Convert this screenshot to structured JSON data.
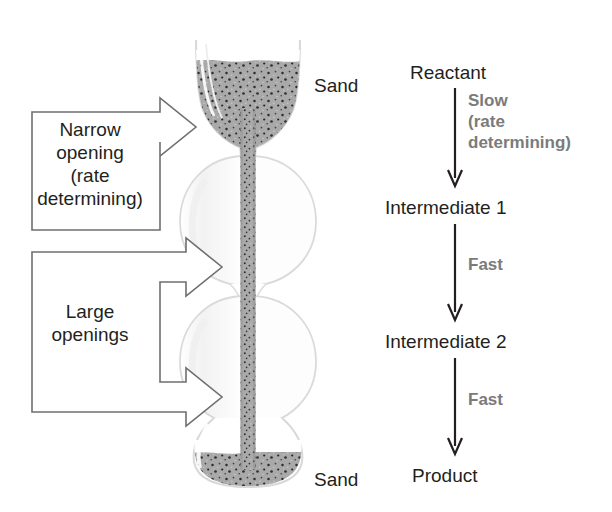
{
  "figure": {
    "background": "#ffffff"
  },
  "colors": {
    "text": "#231f20",
    "rate_label": "#7b7b7b",
    "outline": "#6d6d6d",
    "sand_fill": "#a8a8a8",
    "glass_outline": "#d9d9d9",
    "arrow_stroke": "#58595b"
  },
  "hourglass": {
    "top_sand_label": "Sand",
    "bottom_sand_label": "Sand",
    "stream_name": "sand-stream",
    "bulbs": [
      {
        "name": "top-bulb",
        "filled": true
      },
      {
        "name": "middle-bulb-upper",
        "filled": false
      },
      {
        "name": "middle-bulb-lower",
        "filled": false
      },
      {
        "name": "bottom-bulb",
        "filled": true
      }
    ]
  },
  "callouts": [
    {
      "name": "narrow-opening-callout",
      "text": "Narrow\nopening\n(rate\ndetermining)",
      "arrows": 1
    },
    {
      "name": "large-openings-callout",
      "text": "Large\nopenings",
      "arrows": 2
    }
  ],
  "mechanism": {
    "steps": [
      {
        "species": "Reactant"
      },
      {
        "species": "Intermediate 1"
      },
      {
        "species": "Intermediate 2"
      },
      {
        "species": "Product"
      }
    ],
    "arrows": [
      {
        "label": "Slow\n(rate\ndetermining)"
      },
      {
        "label": "Fast"
      },
      {
        "label": "Fast"
      }
    ]
  }
}
